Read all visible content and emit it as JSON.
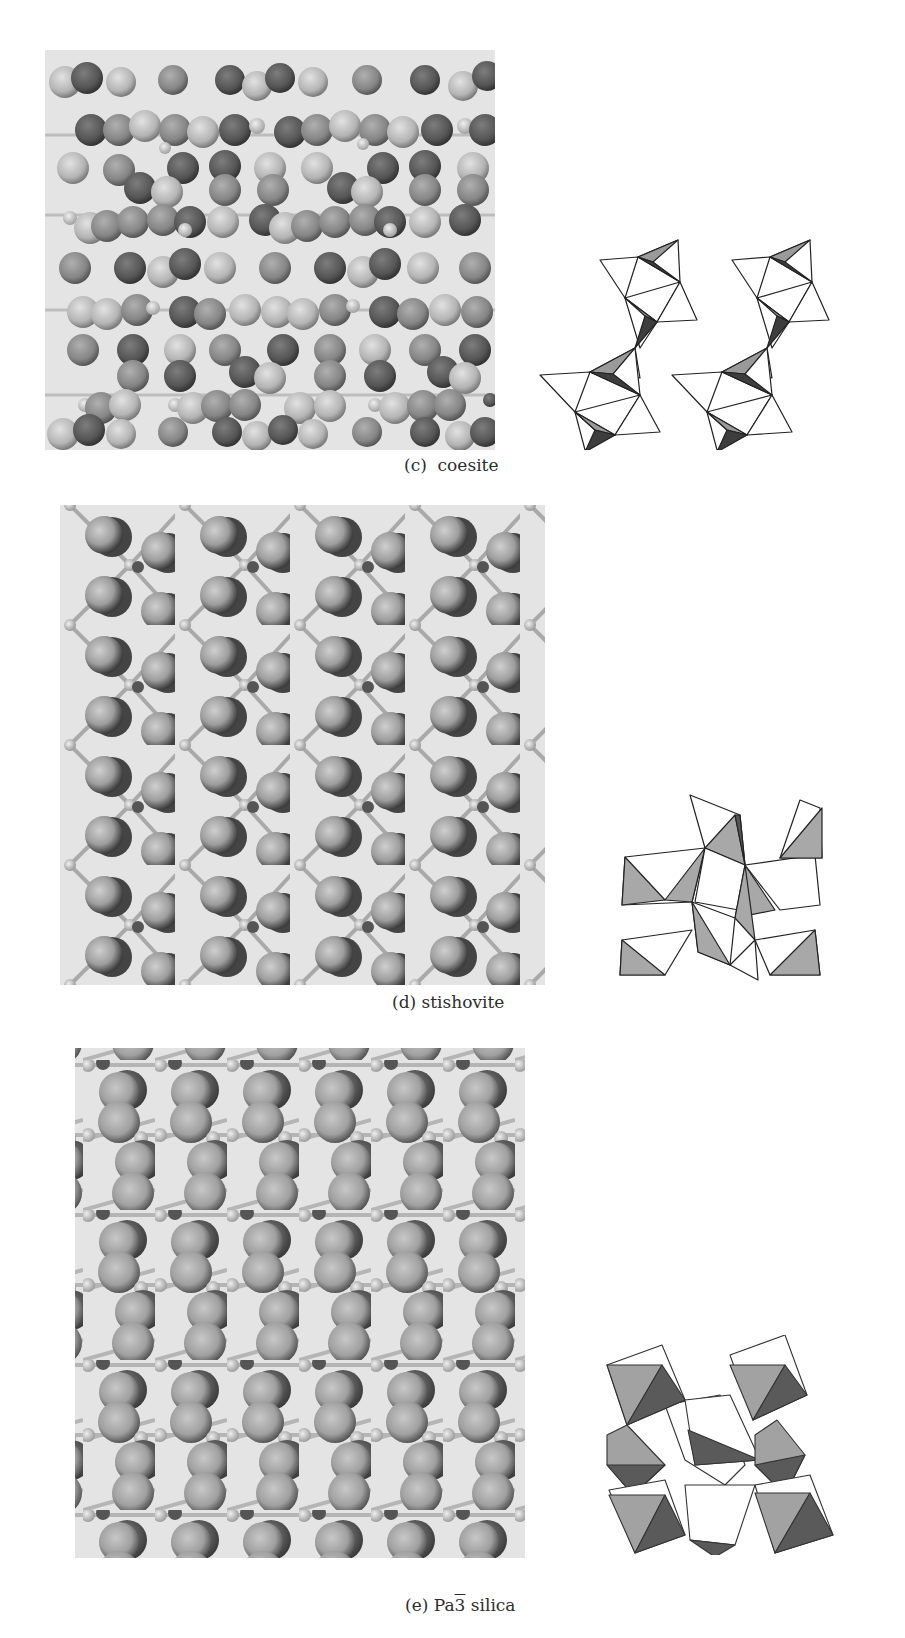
{
  "figure": {
    "subfigures": [
      {
        "id": "c",
        "label": "(c)",
        "name": "coesite",
        "caption": "(c)  coesite",
        "ball_and_stick": {
          "x": 45,
          "y": 50,
          "w": 450,
          "h": 400
        },
        "polyhedral": {
          "x": 535,
          "y": 220,
          "w": 305,
          "h": 230
        }
      },
      {
        "id": "d",
        "label": "(d)",
        "name": "stishovite",
        "caption": "(d) stishovite",
        "ball_and_stick": {
          "x": 60,
          "y": 505,
          "w": 485,
          "h": 480
        },
        "polyhedral": {
          "x": 580,
          "y": 730,
          "w": 250,
          "h": 260
        }
      },
      {
        "id": "e",
        "label": "(e)",
        "name_prefix": "Pa",
        "name_bar": "3",
        "name_suffix": " silica",
        "caption_label": "(e)",
        "ball_and_stick": {
          "x": 75,
          "y": 1048,
          "w": 450,
          "h": 510
        },
        "polyhedral": {
          "x": 605,
          "y": 1335,
          "w": 230,
          "h": 220
        }
      }
    ]
  },
  "colors": {
    "panel_bg": "#e4e4e4",
    "atom_light": "#c8c8c8",
    "atom_mid": "#8e8e8e",
    "atom_dark": "#555555",
    "poly_fill_light": "#a8a8a8",
    "poly_fill_dark": "#4a4a4a",
    "line": "#222222"
  }
}
